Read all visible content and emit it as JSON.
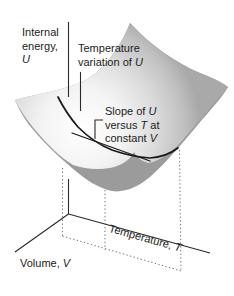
{
  "labels": {
    "internal_energy": {
      "line1": "Internal",
      "line2": "energy,",
      "symbol": "U"
    },
    "temperature_variation": {
      "line1": "Temperature",
      "line2": "variation of ",
      "symbol": "U"
    },
    "slope": {
      "line1_text": "Slope of ",
      "line1_symbol": "U",
      "line2_text": "versus ",
      "line2_symbol": "T",
      "line2_suffix": " at",
      "line3_text": "constant ",
      "line3_symbol": "V"
    },
    "axes": {
      "temperature": {
        "text": "Temperature, ",
        "symbol": "T"
      },
      "volume": {
        "text": "Volume, ",
        "symbol": "V"
      }
    }
  },
  "colors": {
    "background": "#ffffff",
    "surface_rim": "#9b9b9b",
    "surface_highlight": "#ffffff",
    "surface_shadow": "#a9a9a9",
    "axis_line": "#2a2a2a",
    "curve_line": "#1a1a1a",
    "dotted_line": "#6e6e6e",
    "text": "#1b1b1b"
  }
}
